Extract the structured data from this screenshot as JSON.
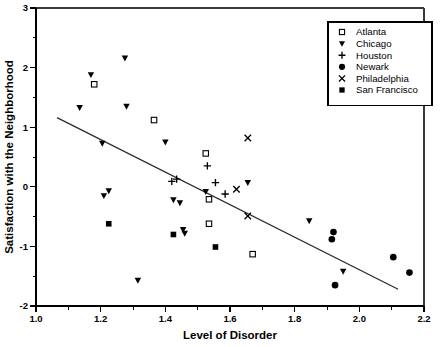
{
  "chart_data": {
    "type": "scatter",
    "title": "",
    "xlabel": "Level of Disorder",
    "ylabel": "Satisfaction with the Neighborhood",
    "xlim": [
      1.0,
      2.2
    ],
    "ylim": [
      -2,
      3
    ],
    "xticks": [
      "1.0",
      "1.2",
      "1.4",
      "1.6",
      "1.8",
      "2.0",
      "2.2"
    ],
    "xtick_values": [
      1.0,
      1.2,
      1.4,
      1.6,
      1.8,
      2.0,
      2.2
    ],
    "xminor_values": [
      1.1,
      1.3,
      1.5,
      1.7,
      1.9,
      2.1
    ],
    "yticks": [
      "3",
      "2",
      "1",
      "0",
      "-1",
      "-2"
    ],
    "ytick_values": [
      3,
      2,
      1,
      0,
      -1,
      -2
    ],
    "yminor_values": [
      2.5,
      1.5,
      0.5,
      -0.5,
      -1.5
    ],
    "grid": false,
    "legend_position": "top-right",
    "trendline": {
      "label": "regression-line",
      "x0": 1.065,
      "y0": 1.16,
      "x1": 2.12,
      "y1": -1.72
    },
    "series": [
      {
        "name": "Atlanta",
        "marker": "open-square",
        "points": [
          [
            1.18,
            1.72
          ],
          [
            1.365,
            1.12
          ],
          [
            1.525,
            0.56
          ],
          [
            1.535,
            -0.21
          ],
          [
            1.535,
            -0.62
          ],
          [
            1.67,
            -1.13
          ]
        ]
      },
      {
        "name": "Chicago",
        "marker": "filled-triangle-down",
        "points": [
          [
            1.135,
            1.33
          ],
          [
            1.17,
            1.88
          ],
          [
            1.205,
            0.73
          ],
          [
            1.21,
            -0.15
          ],
          [
            1.225,
            -0.07
          ],
          [
            1.275,
            2.16
          ],
          [
            1.28,
            1.35
          ],
          [
            1.315,
            -1.57
          ],
          [
            1.4,
            0.75
          ],
          [
            1.425,
            -0.22
          ],
          [
            1.445,
            -0.27
          ],
          [
            1.455,
            -0.72
          ],
          [
            1.46,
            -0.78
          ],
          [
            1.525,
            -0.08
          ],
          [
            1.655,
            0.07
          ],
          [
            1.845,
            -0.57
          ],
          [
            1.95,
            -1.42
          ]
        ]
      },
      {
        "name": "Houston",
        "marker": "plus",
        "points": [
          [
            1.42,
            0.09
          ],
          [
            1.435,
            0.13
          ],
          [
            1.53,
            0.35
          ],
          [
            1.555,
            0.07
          ],
          [
            1.585,
            -0.12
          ]
        ]
      },
      {
        "name": "Newark",
        "marker": "filled-circle",
        "points": [
          [
            1.915,
            -0.88
          ],
          [
            1.92,
            -0.76
          ],
          [
            1.925,
            -1.65
          ],
          [
            2.105,
            -1.18
          ],
          [
            2.155,
            -1.44
          ]
        ]
      },
      {
        "name": "Philadelphia",
        "marker": "cross-x",
        "points": [
          [
            1.655,
            0.82
          ],
          [
            1.62,
            -0.04
          ],
          [
            1.655,
            -0.49
          ]
        ]
      },
      {
        "name": "San Francisco",
        "marker": "filled-square",
        "points": [
          [
            1.225,
            -0.62
          ],
          [
            1.425,
            -0.8
          ],
          [
            1.555,
            -1.01
          ]
        ]
      }
    ]
  },
  "legend": {
    "items": [
      {
        "label": "Atlanta",
        "marker": "open-square"
      },
      {
        "label": "Chicago",
        "marker": "filled-triangle-down"
      },
      {
        "label": "Houston",
        "marker": "plus"
      },
      {
        "label": "Newark",
        "marker": "filled-circle"
      },
      {
        "label": "Philadelphia",
        "marker": "cross-x"
      },
      {
        "label": "San Francisco",
        "marker": "filled-square"
      }
    ]
  },
  "colors": {
    "marker": "#000000",
    "line": "#2b2b2b",
    "axis": "#000000",
    "background": "#ffffff"
  }
}
